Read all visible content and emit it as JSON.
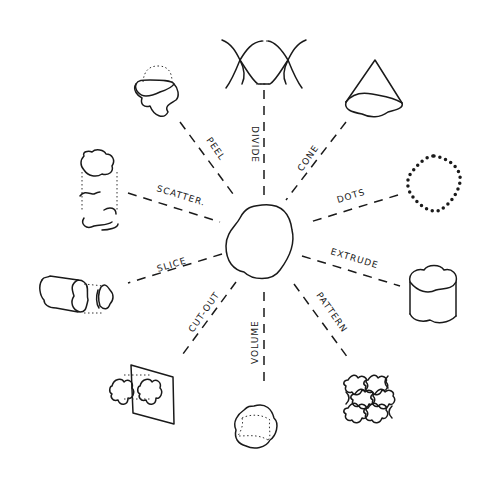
{
  "diagram": {
    "title": "",
    "center": "blob-shape",
    "branches": [
      {
        "label": "DIVIDE"
      },
      {
        "label": "CONE"
      },
      {
        "label": "DOTS"
      },
      {
        "label": "EXTRUDE"
      },
      {
        "label": "PATTERN"
      },
      {
        "label": "VOLUME"
      },
      {
        "label": "CUT-OUT"
      },
      {
        "label": "SLICE"
      },
      {
        "label": "SCATTER."
      },
      {
        "label": "PEEL"
      }
    ]
  }
}
